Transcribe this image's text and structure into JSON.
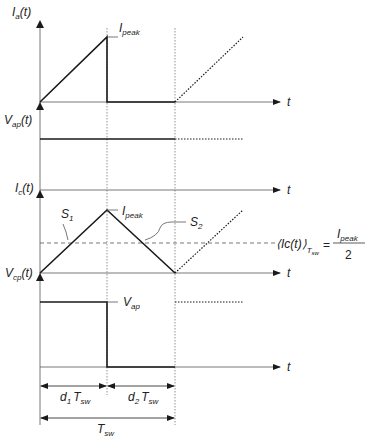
{
  "diagram": {
    "colors": {
      "stroke": "#1a1a1a",
      "axis": "#555555",
      "guide": "#777777"
    },
    "panels": [
      {
        "id": "ia",
        "y_label": {
          "main": "I",
          "sub": "a",
          "tail": "(t)"
        },
        "peak_label": {
          "main": "I",
          "sub": "peak"
        },
        "x_label": "t"
      },
      {
        "id": "vap",
        "y_label": {
          "main": "V",
          "sub": "ap",
          "tail": "(t)"
        }
      },
      {
        "id": "ic",
        "y_label": {
          "main": "I",
          "sub": "c",
          "tail": "(t)"
        },
        "x_label": "t",
        "peak_label": {
          "main": "I",
          "sub": "peak"
        },
        "slope_labels": [
          {
            "main": "S",
            "sub": "1"
          },
          {
            "main": "S",
            "sub": "2"
          }
        ],
        "average": {
          "lhs_main": "⟨Ic(t)⟩",
          "lhs_sub": "T",
          "lhs_subsub": "sw",
          "eq": "=",
          "num_main": "I",
          "num_sub": "peak",
          "den": "2"
        }
      },
      {
        "id": "vcp",
        "y_label": {
          "main": "V",
          "sub": "cp",
          "tail": "(t)"
        },
        "x_label": "t",
        "level_label": {
          "main": "V",
          "sub": "ap"
        }
      }
    ],
    "dimensions": {
      "d1": {
        "pre": "d",
        "idx": "1",
        "main": "T",
        "sub": "sw"
      },
      "d2": {
        "pre": "d",
        "idx": "2",
        "main": "T",
        "sub": "sw"
      },
      "period": {
        "main": "T",
        "sub": "sw"
      }
    }
  }
}
